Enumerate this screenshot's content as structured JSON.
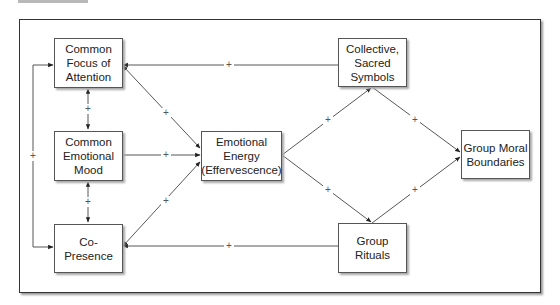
{
  "diagram": {
    "nodes": [
      {
        "id": "focus",
        "label": "Common\nFocus of\nAttention"
      },
      {
        "id": "mood",
        "label": "Common\nEmotional\nMood"
      },
      {
        "id": "copresence",
        "label": "Co-\nPresence"
      },
      {
        "id": "energy",
        "label": "Emotional\nEnergy\n(Effervescence)"
      },
      {
        "id": "symbols",
        "label": "Collective,\nSacred\nSymbols"
      },
      {
        "id": "rituals",
        "label": "Group\nRituals"
      },
      {
        "id": "boundaries",
        "label": "Group Moral\nBoundaries"
      }
    ],
    "edges": [
      {
        "from": "copresence",
        "to": "focus",
        "sign": "+",
        "note": "left bracket loop"
      },
      {
        "from": "focus",
        "to": "mood",
        "sign": "+",
        "bidirectional": true
      },
      {
        "from": "mood",
        "to": "copresence",
        "sign": "+",
        "bidirectional": true
      },
      {
        "from": "focus",
        "to": "energy",
        "sign": "+",
        "bidirectional": true
      },
      {
        "from": "mood",
        "to": "energy",
        "sign": "+"
      },
      {
        "from": "copresence",
        "to": "energy",
        "sign": "+",
        "bidirectional": true
      },
      {
        "from": "symbols",
        "to": "focus",
        "sign": "+"
      },
      {
        "from": "rituals",
        "to": "copresence",
        "sign": "+"
      },
      {
        "from": "energy",
        "to": "symbols",
        "sign": "+"
      },
      {
        "from": "energy",
        "to": "rituals",
        "sign": "+"
      },
      {
        "from": "symbols",
        "to": "boundaries",
        "sign": "+"
      },
      {
        "from": "rituals",
        "to": "boundaries",
        "sign": "+"
      }
    ],
    "plus_sign": "+"
  }
}
